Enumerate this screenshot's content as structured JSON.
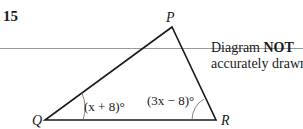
{
  "question": {
    "number": "15",
    "note_prefix": "Diagram ",
    "note_bold": "NOT",
    "note_line2": "accurately drawn"
  },
  "diagram": {
    "type": "triangle",
    "vertices": {
      "P": {
        "label": "P",
        "x": 172,
        "y": 27
      },
      "Q": {
        "label": "Q",
        "x": 45,
        "y": 120
      },
      "R": {
        "label": "R",
        "x": 216,
        "y": 120
      }
    },
    "angles": {
      "Q": "(x + 8)°",
      "R": "(3x − 8)°"
    },
    "colors": {
      "line": "#1a1a1a",
      "rule": "#9a9a9a"
    }
  }
}
